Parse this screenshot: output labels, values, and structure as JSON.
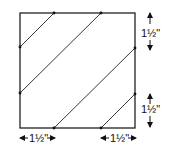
{
  "diagram": {
    "square": {
      "x": 20,
      "y": 13,
      "size": 115,
      "stroke": "#222222"
    },
    "points": [
      {
        "x": 54,
        "y": 13
      },
      {
        "x": 101,
        "y": 13
      },
      {
        "x": 20,
        "y": 47
      },
      {
        "x": 20,
        "y": 93
      },
      {
        "x": 135,
        "y": 48
      },
      {
        "x": 135,
        "y": 94
      },
      {
        "x": 54,
        "y": 128
      },
      {
        "x": 101,
        "y": 128
      }
    ],
    "lines": [
      {
        "x1": 54,
        "y1": 13,
        "x2": 20,
        "y2": 47
      },
      {
        "x1": 101,
        "y1": 13,
        "x2": 20,
        "y2": 93
      },
      {
        "x1": 135,
        "y1": 48,
        "x2": 54,
        "y2": 128
      },
      {
        "x1": 135,
        "y1": 94,
        "x2": 101,
        "y2": 128
      }
    ],
    "labels": {
      "right_top": "1½\"",
      "right_bottom": "1½\"",
      "bottom_left": "1½\"",
      "bottom_right": "1½\""
    }
  }
}
